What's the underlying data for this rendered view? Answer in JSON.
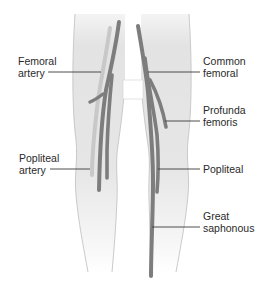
{
  "diagram": {
    "colors": {
      "background": "#ffffff",
      "leg_fill_top": "#e2e2e2",
      "leg_fill_bottom": "#f6f6f6",
      "leg_outline": "#bdbdbd",
      "artery": "#c9c9c9",
      "vein": "#7b7b7b",
      "leader_line": "#3a3a3a",
      "label_text": "#2a2a2a"
    },
    "labels_left": [
      {
        "id": "femoral-artery",
        "text": "Femoral\nartery"
      },
      {
        "id": "popliteal-artery",
        "text": "Popliteal\nartery"
      }
    ],
    "labels_right": [
      {
        "id": "common-femoral",
        "text": "Common\nfemoral"
      },
      {
        "id": "profunda-femoris",
        "text": "Profunda\nfemoris"
      },
      {
        "id": "popliteal",
        "text": "Popliteal"
      },
      {
        "id": "great-saphonous",
        "text": "Great\nsaphonous"
      }
    ]
  }
}
